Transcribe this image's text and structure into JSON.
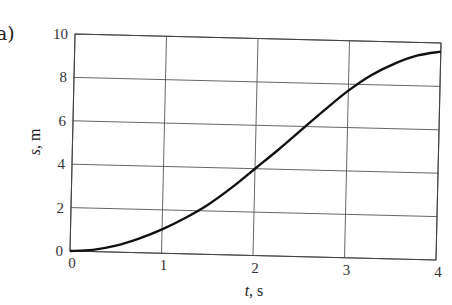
{
  "panel_label": "a)",
  "chart_data": {
    "type": "line",
    "title": "",
    "xlabel": "t, s",
    "ylabel": "s, m",
    "xlim": [
      0,
      4
    ],
    "ylim": [
      0,
      10
    ],
    "x_ticks": [
      "0",
      "1",
      "2",
      "3",
      "4"
    ],
    "y_ticks": [
      "0",
      "2",
      "4",
      "6",
      "8",
      "10"
    ],
    "grid": true,
    "legend": null,
    "series": [
      {
        "name": "s(t)",
        "x": [
          0,
          0.25,
          0.5,
          0.75,
          1.0,
          1.25,
          1.5,
          1.75,
          2.0,
          2.25,
          2.5,
          2.75,
          3.0,
          3.25,
          3.5,
          3.75,
          4.0
        ],
        "values": [
          0,
          0.08,
          0.3,
          0.65,
          1.1,
          1.65,
          2.3,
          3.1,
          4.0,
          4.9,
          5.85,
          6.8,
          7.7,
          8.45,
          9.0,
          9.4,
          9.6
        ]
      }
    ],
    "colors": {
      "line": "#111111",
      "grid": "#555555",
      "frame": "#444444"
    }
  }
}
